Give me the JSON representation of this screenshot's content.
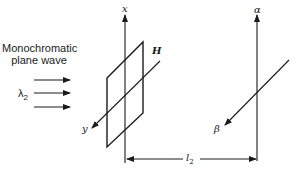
{
  "source": {
    "title_line1": "Monochromatic",
    "title_line2": "plane wave",
    "wavelength_label": "λ",
    "wavelength_subscript": "2"
  },
  "object_plane": {
    "label": "H",
    "vertical_axis": "x",
    "depth_axis": "y"
  },
  "observation_plane": {
    "vertical_axis": "α",
    "depth_axis": "β"
  },
  "distance": {
    "label": "l",
    "subscript": "2"
  },
  "colors": {
    "stroke": "#1a1a1a",
    "background": "#ffffff"
  }
}
